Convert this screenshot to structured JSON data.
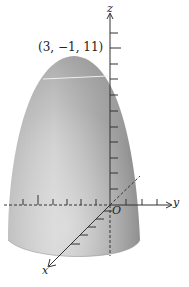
{
  "figure": {
    "type": "3d-surface-plot",
    "surface": "paraboloid (downward-opening, vertex at top)",
    "annotations": {
      "vertex_point": "(3, −1, 11)"
    },
    "axes": {
      "x": {
        "label": "x",
        "direction": "toward viewer, lower-left",
        "ticks": 5
      },
      "y": {
        "label": "y",
        "direction": "right",
        "ticks_positive": 3,
        "ticks_negative": 9
      },
      "z": {
        "label": "z",
        "direction": "up",
        "ticks": 11
      },
      "origin": "O"
    },
    "colors": {
      "surface_light": "#d8d8d8",
      "surface_dark": "#8c8c8c",
      "axis": "#333333",
      "background": "#ffffff"
    }
  }
}
